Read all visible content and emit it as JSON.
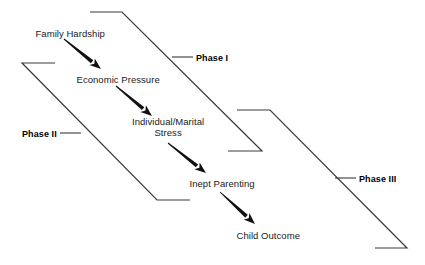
{
  "diagram": {
    "background_color": "#ffffff",
    "line_color": "#3a3a3a",
    "arrow_color": "#111111",
    "text_color": "#1a1a1a",
    "nodes": [
      {
        "id": "family-hardship",
        "label": "Family Hardship",
        "cx": 70,
        "cy": 33
      },
      {
        "id": "economic-pressure",
        "label": "Economic Pressure",
        "cx": 118,
        "cy": 79
      },
      {
        "id": "individual-marital-stress",
        "label_line1": "Individual/Marital",
        "label_line2": "Stress",
        "cx": 168,
        "cy": 127
      },
      {
        "id": "inept-parenting",
        "label": "Inept Parenting",
        "cx": 222,
        "cy": 183
      },
      {
        "id": "child-outcome",
        "label": "Child Outcome",
        "cx": 268,
        "cy": 235
      }
    ],
    "arrows": [
      {
        "id": "arrow-hardship-to-pressure",
        "from": "family-hardship",
        "to": "economic-pressure",
        "x1": 64,
        "y1": 39,
        "x2": 101,
        "y2": 69
      },
      {
        "id": "arrow-pressure-to-stress",
        "from": "economic-pressure",
        "to": "individual-marital-stress",
        "x1": 116,
        "y1": 86,
        "x2": 152,
        "y2": 116
      },
      {
        "id": "arrow-stress-to-parenting",
        "from": "individual-marital-stress",
        "to": "inept-parenting",
        "x1": 168,
        "y1": 143,
        "x2": 206,
        "y2": 173
      },
      {
        "id": "arrow-parenting-to-outcome",
        "from": "inept-parenting",
        "to": "child-outcome",
        "x1": 220,
        "y1": 192,
        "x2": 255,
        "y2": 224
      }
    ],
    "phases": [
      {
        "id": "phase-1",
        "label": "Phase I",
        "label_x": 196,
        "label_y": 53,
        "leader": {
          "x1": 172,
          "y1": 57,
          "x2": 193,
          "y2": 57
        },
        "bracket_path": "M 90 12 L 122 12 L 262 151 L 228 151",
        "tick_side": "left"
      },
      {
        "id": "phase-2",
        "label": "Phase II",
        "label_x": 22,
        "label_y": 129,
        "leader": {
          "x1": 60,
          "y1": 133,
          "x2": 81,
          "y2": 133
        },
        "bracket_path": "M 55 63 L 22 63 L 157 200 L 190 200",
        "tick_side": "right"
      },
      {
        "id": "phase-3",
        "label": "Phase III",
        "label_x": 359,
        "label_y": 174,
        "leader": {
          "x1": 335,
          "y1": 178,
          "x2": 356,
          "y2": 178
        },
        "bracket_path": "M 237 110 L 270 110 L 407 248 L 375 248",
        "tick_side": "left"
      }
    ]
  }
}
